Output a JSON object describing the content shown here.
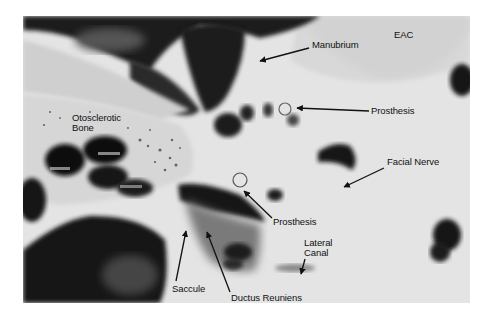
{
  "figure": {
    "type": "grayscale histology photomicrograph",
    "labels": [
      {
        "id": "eac",
        "text": "EAC",
        "x": 394,
        "y": 30
      },
      {
        "id": "manubrium",
        "text": "Manubrium",
        "x": 312,
        "y": 40
      },
      {
        "id": "prosthesis-upper",
        "text": "Prosthesis",
        "x": 371,
        "y": 106
      },
      {
        "id": "otosclerotic-bone-1",
        "text": "Otosclerotic",
        "x": 72,
        "y": 113
      },
      {
        "id": "otosclerotic-bone-2",
        "text": "Bone",
        "x": 72,
        "y": 123
      },
      {
        "id": "facial-nerve",
        "text": "Facial Nerve",
        "x": 387,
        "y": 157
      },
      {
        "id": "prosthesis-lower",
        "text": "Prosthesis",
        "x": 273,
        "y": 217
      },
      {
        "id": "lateral-canal-1",
        "text": "Lateral",
        "x": 304,
        "y": 238
      },
      {
        "id": "lateral-canal-2",
        "text": "Canal",
        "x": 304,
        "y": 248
      },
      {
        "id": "saccule",
        "text": "Saccule",
        "x": 172,
        "y": 284
      },
      {
        "id": "ductus-reuniens",
        "text": "Ductus Reuniens",
        "x": 231,
        "y": 293
      }
    ]
  }
}
